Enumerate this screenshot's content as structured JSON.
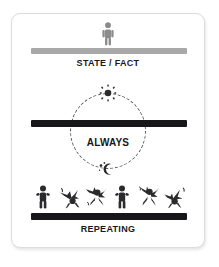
{
  "card": {
    "border_color": "#dcdcdc",
    "background": "#ffffff"
  },
  "colors": {
    "gray_bar": "#a9a9a9",
    "black_bar": "#17171a",
    "figure_gray": "#8c8c8c",
    "figure_dark": "#2b2b2e",
    "text": "#19191c"
  },
  "sections": {
    "state": {
      "caption": "STATE / FACT",
      "icon": "standing-person-icon",
      "bar_style": "gray"
    },
    "always": {
      "label": "ALWAYS",
      "sun_icon": "sun-icon",
      "moon_icon": "moon-stars-icon",
      "bar_style": "black"
    },
    "repeating": {
      "caption": "REPEATING",
      "bar_style": "black",
      "figures": [
        {
          "pose": "standing",
          "icon": "standing-person-icon"
        },
        {
          "pose": "jumping",
          "icon": "jumping-person-icon"
        },
        {
          "pose": "jumping",
          "icon": "jumping-person-icon"
        },
        {
          "pose": "standing",
          "icon": "standing-person-icon"
        },
        {
          "pose": "jumping",
          "icon": "jumping-person-icon"
        },
        {
          "pose": "jumping",
          "icon": "jumping-person-icon"
        }
      ]
    }
  }
}
